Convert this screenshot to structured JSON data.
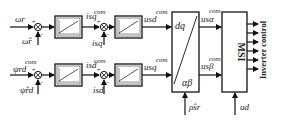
{
  "diagram": {
    "title": "",
    "rows": [
      {
        "input_label": "ω_r",
        "input_symbol": "ωr",
        "feedback_label": "ω̂_r",
        "feedback_symbol": "ω̂r",
        "sum_signs": [
          "+",
          "-"
        ],
        "controller1_output": "i_sq^com",
        "controller1_output_main": "isq",
        "controller1_output_sup": "com",
        "inner_feedback": "i_sq",
        "inner_feedback_symbol": "isq",
        "controller2_output": "u_sd^com",
        "controller2_output_main": "usd",
        "controller2_output_sup": "com",
        "transform_output": "u_sα^com",
        "transform_output_main": "usα",
        "transform_output_sup": "com"
      },
      {
        "input_label": "ψ_rd^com",
        "input_symbol": "ψrd",
        "input_sup": "com",
        "feedback_label": "ψ̂_rd",
        "feedback_symbol": "ψ̂rd",
        "sum_signs": [
          "+",
          "-"
        ],
        "controller1_output": "i_sd^com",
        "controller1_output_main": "isd",
        "controller1_output_sup": "com",
        "inner_feedback": "i_sd",
        "inner_feedback_symbol": "isd",
        "controller2_output": "u_sq^com",
        "controller2_output_main": "usq",
        "controller2_output_sup": "com",
        "transform_output": "u_sβ^com",
        "transform_output_main": "usβ",
        "transform_output_sup": "com"
      }
    ],
    "transform_block": {
      "top": "dq",
      "bottom": "αβ",
      "angle_input": "ρ̂_sr",
      "angle_symbol": "ρ̂sr"
    },
    "modulator_block": {
      "label": "MSI",
      "dc_input": "u_d",
      "dc_symbol": "ud",
      "output_count": 6
    },
    "output_label": "Inverter control"
  }
}
